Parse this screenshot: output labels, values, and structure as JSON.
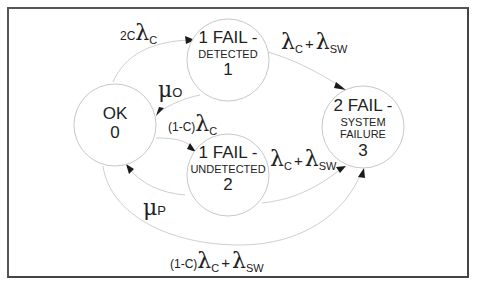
{
  "diagram": {
    "type": "markov-state-transition",
    "states": [
      {
        "id": 0,
        "title": "OK",
        "subtitle": "",
        "number": "0"
      },
      {
        "id": 1,
        "title": "1 FAIL -",
        "subtitle": "DETECTED",
        "number": "1"
      },
      {
        "id": 2,
        "title": "1 FAIL -",
        "subtitle": "UNDETECTED",
        "number": "2"
      },
      {
        "id": 3,
        "title": "2 FAIL -",
        "subtitle_line1": "SYSTEM",
        "subtitle_line2": "FAILURE",
        "number": "3"
      }
    ],
    "transitions": [
      {
        "from": 0,
        "to": 1,
        "label": {
          "prefix": "2C",
          "symbol": "λ",
          "sub": "C"
        }
      },
      {
        "from": 1,
        "to": 0,
        "label": {
          "symbol": "μ",
          "sub": "O"
        }
      },
      {
        "from": 0,
        "to": 2,
        "label": {
          "prefix": "(1-C)",
          "symbol": "λ",
          "sub": "C"
        }
      },
      {
        "from": 2,
        "to": 0,
        "label": {
          "symbol": "μ",
          "sub": "P"
        }
      },
      {
        "from": 1,
        "to": 3,
        "label": {
          "symbol": "λ",
          "sub": "C",
          "plus": "+",
          "symbol2": "λ",
          "sub2": "SW"
        }
      },
      {
        "from": 2,
        "to": 3,
        "label": {
          "symbol": "λ",
          "sub": "C",
          "plus": "+",
          "symbol2": "λ",
          "sub2": "SW"
        }
      },
      {
        "from": 0,
        "to": 3,
        "label": {
          "prefix": "(1-C)",
          "symbol": "λ",
          "sub": "C",
          "plus": "+",
          "symbol2": "λ",
          "sub2": "SW"
        }
      }
    ]
  }
}
